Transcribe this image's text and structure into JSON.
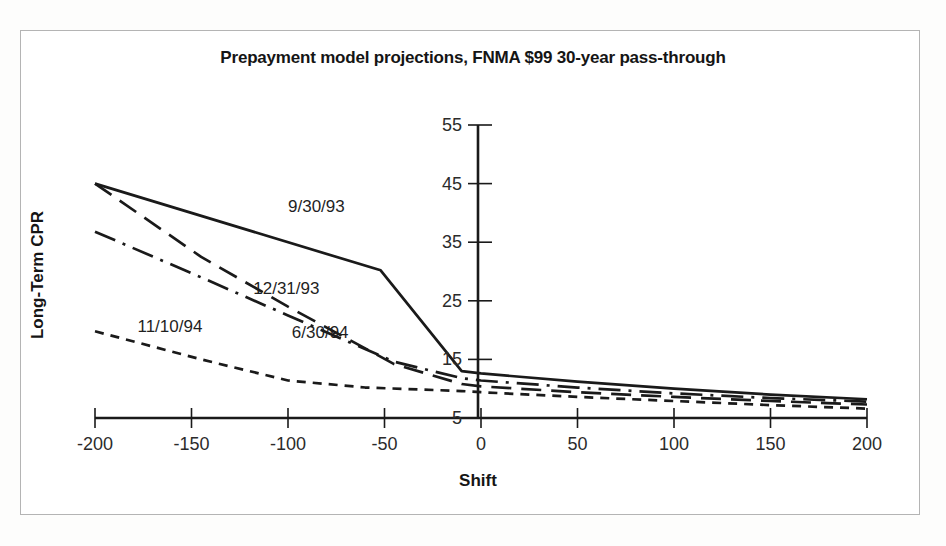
{
  "figure": {
    "border_color": "#b4b4b4",
    "background": "#ffffff",
    "line_color": "#1a1a1a"
  },
  "chart_data": {
    "type": "line",
    "title": "Prepayment model projections, FNMA $99 30-year pass-through",
    "xlabel": "Shift",
    "ylabel": "Long-Term CPR",
    "xlim": [
      -200,
      200
    ],
    "ylim": [
      5,
      55
    ],
    "xticks": [
      -200,
      -150,
      -100,
      -50,
      0,
      50,
      100,
      150,
      200
    ],
    "xtick_labels": [
      "-200",
      "-150",
      "-100",
      "-50",
      "0",
      "50",
      "100",
      "150",
      "200"
    ],
    "yticks": [
      5,
      15,
      25,
      35,
      45,
      55
    ],
    "ytick_labels": [
      "5",
      "15",
      "25",
      "35",
      "45",
      "55"
    ],
    "grid": false,
    "legend": "inline-annotations",
    "series": [
      {
        "name": "9/30/93",
        "style": "solid",
        "label_x": -100,
        "label_y": 41,
        "x": [
          -200,
          -52,
          -10,
          0,
          50,
          100,
          150,
          200
        ],
        "y": [
          45.0,
          30.2,
          13.0,
          12.6,
          11.2,
          10.0,
          9.0,
          8.2
        ]
      },
      {
        "name": "12/31/93",
        "style": "long-dash-dot",
        "label_x": -118,
        "label_y": 27,
        "x": [
          -200,
          -145,
          -100,
          -45,
          -10,
          0,
          50,
          100,
          150,
          200
        ],
        "y": [
          36.8,
          29.0,
          22.5,
          14.6,
          11.8,
          11.4,
          10.2,
          9.2,
          8.4,
          7.8
        ]
      },
      {
        "name": "6/30/94",
        "style": "medium-dash",
        "label_x": -98,
        "label_y": 19.5,
        "x": [
          -200,
          -145,
          -100,
          -45,
          -10,
          0,
          50,
          100,
          150,
          200
        ],
        "y": [
          45.0,
          32.5,
          24.0,
          14.2,
          10.8,
          10.4,
          9.4,
          8.6,
          7.9,
          7.3
        ],
        "note": "shares start point with 9/30/93 at shift -200"
      },
      {
        "name": "11/10/94",
        "style": "short-dash",
        "label_x": -178,
        "label_y": 20.5,
        "x": [
          -200,
          -145,
          -100,
          -60,
          -10,
          0,
          50,
          100,
          150,
          200
        ],
        "y": [
          19.8,
          15.0,
          11.4,
          10.2,
          9.6,
          9.4,
          8.6,
          7.9,
          7.2,
          6.6
        ]
      }
    ]
  }
}
